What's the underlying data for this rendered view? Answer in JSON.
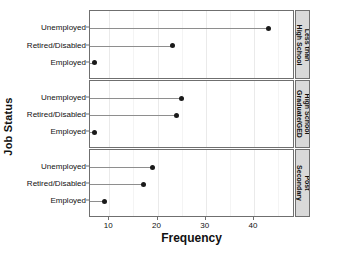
{
  "chart_data": {
    "type": "scatter",
    "subtype": "lollipop-dot-plot-faceted",
    "title": "",
    "xlabel": "Frequency",
    "ylabel": "Job Status",
    "orientation": "horizontal",
    "xlim": [
      6,
      48.5
    ],
    "xticks": [
      10,
      20,
      30,
      40
    ],
    "xtick_labels": [
      "10",
      "20",
      "30",
      "40"
    ],
    "categories": [
      "Employed",
      "Retired/Disabled",
      "Unemployed"
    ],
    "category_order_top_to_bottom": [
      "Unemployed",
      "Retired/Disabled",
      "Employed"
    ],
    "grid": true,
    "legend": "none",
    "facet_position": "right",
    "facets": [
      {
        "label": "Less than High School",
        "label_lines": [
          "Less than",
          "High School"
        ],
        "values": [
          {
            "category": "Unemployed",
            "value": 43
          },
          {
            "category": "Retired/Disabled",
            "value": 23
          },
          {
            "category": "Employed",
            "value": 7
          }
        ]
      },
      {
        "label": "High School Graduate/GED",
        "label_lines": [
          "High School",
          "Graduate/GED"
        ],
        "values": [
          {
            "category": "Unemployed",
            "value": 25
          },
          {
            "category": "Retired/Disabled",
            "value": 24
          },
          {
            "category": "Employed",
            "value": 7
          }
        ]
      },
      {
        "label": "Post Secondary",
        "label_lines": [
          "Post",
          "Secondary"
        ],
        "values": [
          {
            "category": "Unemployed",
            "value": 19
          },
          {
            "category": "Retired/Disabled",
            "value": 17
          },
          {
            "category": "Employed",
            "value": 9
          }
        ]
      }
    ],
    "colors": {
      "dot": "#1a1a1a",
      "line": "#8e8e8e",
      "panel_border": "#6f6f6f",
      "strip_background": "#d9d9d9",
      "gridline": "#eaeaea",
      "background": "#ffffff"
    }
  }
}
